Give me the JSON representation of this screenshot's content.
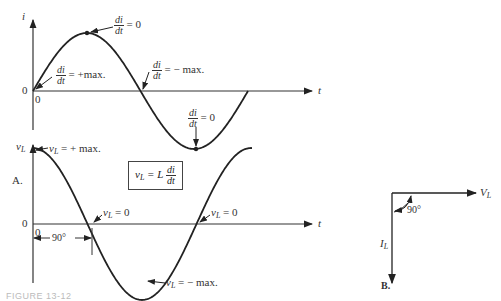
{
  "top_graph": {
    "y_axis_label": "i",
    "x_axis_label": "t",
    "origin_y": "0",
    "origin_x": "0",
    "annotations": {
      "peak": {
        "num": "di",
        "den": "dt",
        "text": "= 0"
      },
      "start": {
        "num": "di",
        "den": "dt",
        "text": "= +max."
      },
      "cross": {
        "num": "di",
        "den": "dt",
        "text": "= − max."
      },
      "trough": {
        "num": "di",
        "den": "dt",
        "text": "= 0"
      }
    }
  },
  "bottom_graph": {
    "y_axis_label": "v",
    "y_axis_sub": "L",
    "x_axis_label": "t",
    "origin_y": "0",
    "origin_x": "0",
    "part_label": "A.",
    "phase_label": "90°",
    "annotations": {
      "max": {
        "v": "v",
        "sub": "L",
        "text": "= + max."
      },
      "zero1": {
        "v": "v",
        "sub": "L",
        "text": "= 0"
      },
      "zero2": {
        "v": "v",
        "sub": "L",
        "text": "= 0"
      },
      "min": {
        "v": "v",
        "sub": "L",
        "text": "= − max."
      }
    },
    "formula": {
      "lhs": "v",
      "lhs_sub": "L",
      "eq": "= L",
      "num": "di",
      "den": "dt"
    }
  },
  "phasor": {
    "horizontal_label": "V",
    "horizontal_sub": "L",
    "vertical_label": "I",
    "vertical_sub": "L",
    "angle_label": "90°",
    "part_label": "B."
  },
  "caption": "FIGURE 13-12"
}
